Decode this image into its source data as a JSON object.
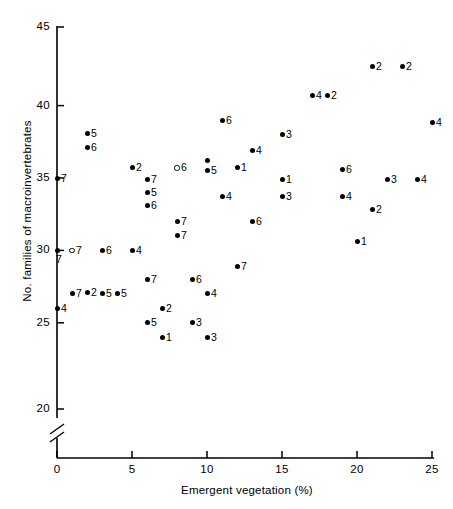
{
  "chart_data": {
    "type": "scatter",
    "title": "",
    "xlabel": "Emergent vegetation (%)",
    "ylabel": "No. families of macroinvertebrates",
    "xlim": [
      0,
      25
    ],
    "ylim": [
      19.2,
      45.8
    ],
    "xticks": [
      0,
      5,
      10,
      15,
      20,
      25
    ],
    "yticks": [
      20,
      25,
      30,
      35,
      40,
      45
    ],
    "xtick_labels": [
      "0",
      "5",
      "10",
      "15",
      "20",
      "25"
    ],
    "ytick_labels": [
      "20",
      "25",
      "30",
      "35",
      "40",
      "45"
    ],
    "grid": false,
    "legend": false,
    "axis_break": {
      "axis": "y",
      "below": 20,
      "style": "double-slash"
    },
    "marker_styles": [
      "filled-circle",
      "open-circle"
    ],
    "point_label_meaning": "site number",
    "points": [
      {
        "x": 0,
        "y": 35.0,
        "label": "7",
        "marker": "filled",
        "label_pos": "right"
      },
      {
        "x": 0,
        "y": 30.0,
        "label": "7",
        "marker": "filled",
        "label_pos": "below"
      },
      {
        "x": 0,
        "y": 26.0,
        "label": "4",
        "marker": "filled",
        "label_pos": "right"
      },
      {
        "x": 1,
        "y": 30.0,
        "label": "7",
        "marker": "open",
        "label_pos": "right"
      },
      {
        "x": 1,
        "y": 27.0,
        "label": "7",
        "marker": "filled",
        "label_pos": "right"
      },
      {
        "x": 2,
        "y": 38.1,
        "label": "5",
        "marker": "filled",
        "label_pos": "right"
      },
      {
        "x": 2,
        "y": 37.1,
        "label": "6",
        "marker": "filled",
        "label_pos": "right"
      },
      {
        "x": 2,
        "y": 27.1,
        "label": "2",
        "marker": "filled",
        "label_pos": "right"
      },
      {
        "x": 3,
        "y": 30.0,
        "label": "6",
        "marker": "filled",
        "label_pos": "right"
      },
      {
        "x": 3,
        "y": 27.0,
        "label": "5",
        "marker": "filled",
        "label_pos": "right"
      },
      {
        "x": 4,
        "y": 27.0,
        "label": "5",
        "marker": "filled",
        "label_pos": "right"
      },
      {
        "x": 5,
        "y": 35.7,
        "label": "2",
        "marker": "filled",
        "label_pos": "right"
      },
      {
        "x": 5,
        "y": 30.0,
        "label": "4",
        "marker": "filled",
        "label_pos": "right"
      },
      {
        "x": 6,
        "y": 34.9,
        "label": "7",
        "marker": "filled",
        "label_pos": "right"
      },
      {
        "x": 6,
        "y": 34.0,
        "label": "5",
        "marker": "filled",
        "label_pos": "right"
      },
      {
        "x": 6,
        "y": 33.1,
        "label": "6",
        "marker": "filled",
        "label_pos": "right"
      },
      {
        "x": 6,
        "y": 28.0,
        "label": "7",
        "marker": "filled",
        "label_pos": "right"
      },
      {
        "x": 6,
        "y": 25.0,
        "label": "5",
        "marker": "filled",
        "label_pos": "right"
      },
      {
        "x": 7,
        "y": 26.0,
        "label": "2",
        "marker": "filled",
        "label_pos": "right"
      },
      {
        "x": 7,
        "y": 24.0,
        "label": "1",
        "marker": "filled",
        "label_pos": "right"
      },
      {
        "x": 8,
        "y": 35.7,
        "label": "6",
        "marker": "open",
        "label_pos": "right"
      },
      {
        "x": 8,
        "y": 32.0,
        "label": "7",
        "marker": "filled",
        "label_pos": "right"
      },
      {
        "x": 8,
        "y": 31.0,
        "label": "7",
        "marker": "filled",
        "label_pos": "right"
      },
      {
        "x": 9,
        "y": 28.0,
        "label": "6",
        "marker": "filled",
        "label_pos": "right"
      },
      {
        "x": 9,
        "y": 25.0,
        "label": "3",
        "marker": "filled",
        "label_pos": "right"
      },
      {
        "x": 10,
        "y": 36.2,
        "label": "",
        "marker": "filled",
        "label_pos": "right"
      },
      {
        "x": 10,
        "y": 35.5,
        "label": "5",
        "marker": "filled",
        "label_pos": "right"
      },
      {
        "x": 10,
        "y": 27.0,
        "label": "4",
        "marker": "filled",
        "label_pos": "right"
      },
      {
        "x": 10,
        "y": 24.0,
        "label": "3",
        "marker": "filled",
        "label_pos": "right"
      },
      {
        "x": 11,
        "y": 39.0,
        "label": "6",
        "marker": "filled",
        "label_pos": "right"
      },
      {
        "x": 11,
        "y": 33.7,
        "label": "4",
        "marker": "filled",
        "label_pos": "right"
      },
      {
        "x": 12,
        "y": 35.7,
        "label": "1",
        "marker": "filled",
        "label_pos": "right"
      },
      {
        "x": 12,
        "y": 28.9,
        "label": "7",
        "marker": "filled",
        "label_pos": "right"
      },
      {
        "x": 13,
        "y": 36.9,
        "label": "4",
        "marker": "filled",
        "label_pos": "right"
      },
      {
        "x": 13,
        "y": 32.0,
        "label": "6",
        "marker": "filled",
        "label_pos": "right"
      },
      {
        "x": 15,
        "y": 38.0,
        "label": "3",
        "marker": "filled",
        "label_pos": "right"
      },
      {
        "x": 15,
        "y": 34.9,
        "label": "1",
        "marker": "filled",
        "label_pos": "right"
      },
      {
        "x": 15,
        "y": 33.7,
        "label": "3",
        "marker": "filled",
        "label_pos": "right"
      },
      {
        "x": 17,
        "y": 40.7,
        "label": "4",
        "marker": "filled",
        "label_pos": "right"
      },
      {
        "x": 18,
        "y": 40.7,
        "label": "2",
        "marker": "filled",
        "label_pos": "right"
      },
      {
        "x": 19,
        "y": 35.6,
        "label": "6",
        "marker": "filled",
        "label_pos": "right"
      },
      {
        "x": 19,
        "y": 33.7,
        "label": "4",
        "marker": "filled",
        "label_pos": "right"
      },
      {
        "x": 20,
        "y": 30.6,
        "label": "1",
        "marker": "filled",
        "label_pos": "right"
      },
      {
        "x": 21,
        "y": 42.7,
        "label": "2",
        "marker": "filled",
        "label_pos": "right"
      },
      {
        "x": 21,
        "y": 32.8,
        "label": "2",
        "marker": "filled",
        "label_pos": "right"
      },
      {
        "x": 22,
        "y": 34.9,
        "label": "3",
        "marker": "filled",
        "label_pos": "right"
      },
      {
        "x": 23,
        "y": 42.7,
        "label": "2",
        "marker": "filled",
        "label_pos": "right"
      },
      {
        "x": 24,
        "y": 34.9,
        "label": "4",
        "marker": "filled",
        "label_pos": "right"
      },
      {
        "x": 25,
        "y": 38.8,
        "label": "4",
        "marker": "filled",
        "label_pos": "right"
      }
    ]
  }
}
